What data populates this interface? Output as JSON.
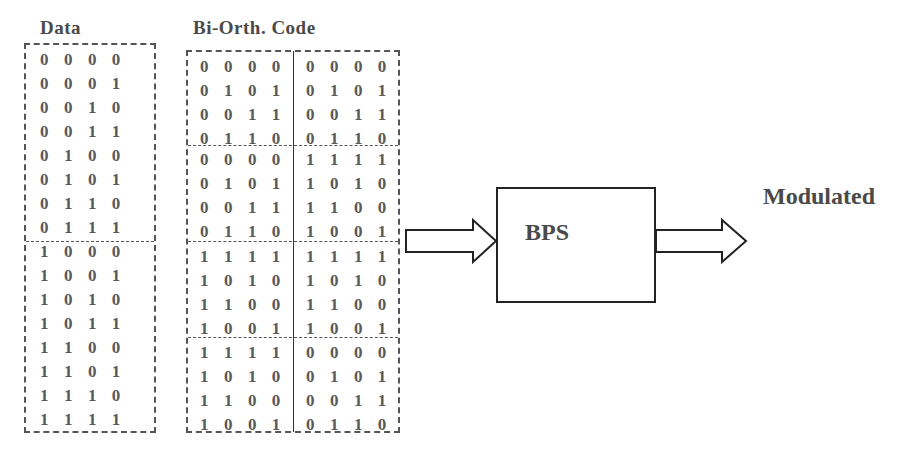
{
  "diagram": {
    "data_column": {
      "title": "Data",
      "groups": [
        [
          "0 0 0 0",
          "0 0 0 1",
          "0 0 1 0",
          "0 0 1 1",
          "0 1 0 0",
          "0 1 0 1",
          "0 1 1 0",
          "0 1 1 1"
        ],
        [
          "1 0 0 0",
          "1 0 0 1",
          "1 0 1 0",
          "1 0 1 1",
          "1 1 0 0",
          "1 1 0 1",
          "1 1 1 0",
          "1 1 1 1"
        ]
      ]
    },
    "code_column": {
      "title": "Bi-Orth. Code",
      "blocks": [
        {
          "left": [
            "0 0 0 0",
            "0 1 0 1",
            "0 0 1 1",
            "0 1 1 0"
          ],
          "right": [
            "0 0 0 0",
            "0 1 0 1",
            "0 0 1 1",
            "0 1 1 0"
          ]
        },
        {
          "left": [
            "0 0 0 0",
            "0 1 0 1",
            "0 0 1 1",
            "0 1 1 0"
          ],
          "right": [
            "1 1 1 1",
            "1 0 1 0",
            "1 1 0 0",
            "1 0 0 1"
          ]
        },
        {
          "left": [
            "1 1 1 1",
            "1 0 1 0",
            "1 1 0 0",
            "1 0 0 1"
          ],
          "right": [
            "1 1 1 1",
            "1 0 1 0",
            "1 1 0 0",
            "1 0 0 1"
          ]
        },
        {
          "left": [
            "1 1 1 1",
            "1 0 1 0",
            "1 1 0 0",
            "1 0 0 1"
          ],
          "right": [
            "0 0 0 0",
            "0 1 0 1",
            "0 0 1 1",
            "0 1 1 0"
          ]
        }
      ]
    },
    "block": {
      "label": "BPS"
    },
    "output": {
      "label": "Modulated"
    },
    "arrows": [
      {
        "from": "code_column",
        "to": "block"
      },
      {
        "from": "block",
        "to": "output"
      }
    ]
  }
}
